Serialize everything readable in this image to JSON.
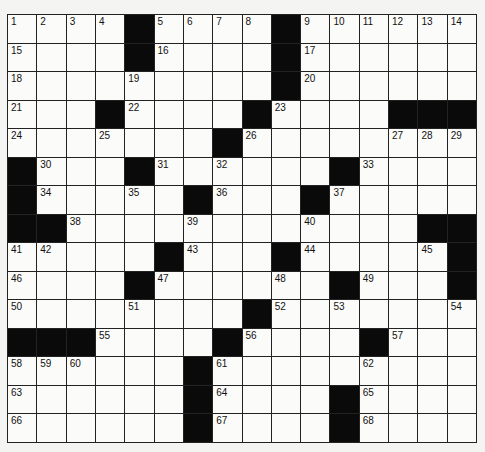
{
  "puzzle": {
    "cols": 16,
    "rows": 15,
    "colors": {
      "black": "#0a0a0a",
      "white": "#fbfbf9",
      "line": "#222222"
    },
    "grid": [
      "1,2,3,4,#,5,6,7,8,#,9,10,11,12,13,14",
      "15,.,.,.,#,16,.,.,.,#,17,.,.,.,.,.",
      "18,.,.,.,19,.,.,.,.,#,20,.,.,.,.,.",
      "21,.,.,#,22,.,.,.,#,23,.,.,.,#,#,#",
      "24,.,.,25,.,.,.,#,26,.,.,.,.,27,28,29",
      "#,30,.,.,#,31,.,32,.,.,.,#,33,.,.,.",
      "#,34,.,.,35,.,#,36,.,.,#,37,.,.,.,.",
      "#,#,38,.,.,.,39,.,.,.,40,.,.,.,#,#",
      "41,42,.,.,.,#,43,.,.,#,44,.,.,.,45,#",
      "46,.,.,.,#,47,.,.,.,48,.,#,49,.,.,#",
      "50,.,.,.,51,.,.,.,#,52,.,53,.,.,.,54",
      "#,#,#,55,.,.,.,#,56,.,.,.,#,57,.,.",
      "58,59,60,.,.,.,#,61,.,.,.,.,62,.,.,.",
      "63,.,.,.,.,.,#,64,.,.,.,#,65,.,.,.",
      "66,.,.,.,.,.,#,67,.,.,.,#,68,.,.,."
    ]
  }
}
